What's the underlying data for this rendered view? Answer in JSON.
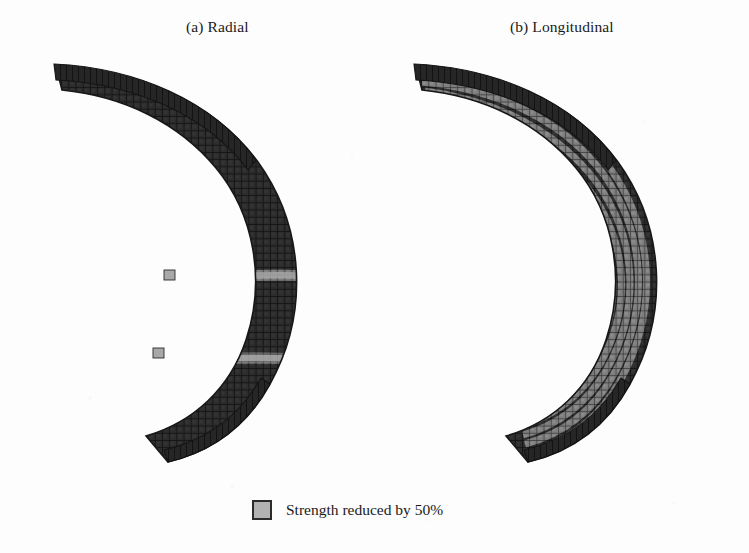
{
  "figure": {
    "panels": [
      {
        "id": "radial",
        "caption": "(a) Radial",
        "damage_orientation": "radial",
        "weakened_band_count": 2
      },
      {
        "id": "longitudinal",
        "caption": "(b) Longitudinal",
        "damage_orientation": "longitudinal",
        "weakened_band_count": 8
      }
    ],
    "legend": {
      "swatch_name": "weakened-element-swatch",
      "label": "Strength reduced by 50%"
    },
    "colors": {
      "mesh_dark": "#2d2d2d",
      "mesh_edge": "#151515",
      "weakened_gray": "#a6a6a6",
      "legend_swatch": "#b2b2b2",
      "background": "#fdfdfd",
      "text": "#1a1a1a"
    }
  }
}
